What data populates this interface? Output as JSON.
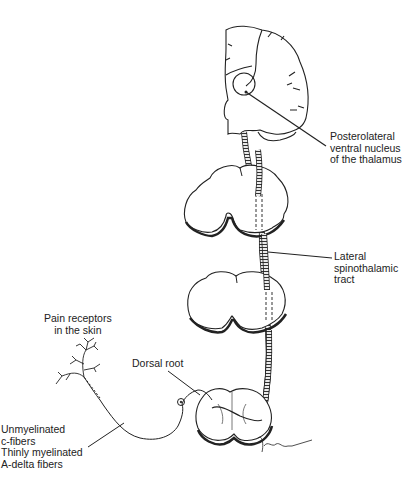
{
  "diagram": {
    "labels": {
      "thalamus": "Posterolateral\nventral nucleus\nof the thalamus",
      "tract": "Lateral\nspinothalamic\ntract",
      "receptors": "Pain receptors\nin the skin",
      "dorsal_root": "Dorsal root",
      "fibers": "Unmyelinated\nc-fibers\nThinly myelinated\nA-delta fibers"
    },
    "structures": [
      "brain coronal section",
      "upper cord section",
      "middle cord section",
      "lower cord section",
      "spinothalamic tract",
      "peripheral nerve",
      "free nerve endings",
      "dorsal root ganglion"
    ]
  }
}
